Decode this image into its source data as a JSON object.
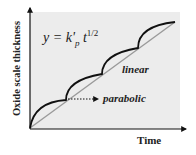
{
  "diagram": {
    "equation": {
      "lhs": "y = k'",
      "subscript": "p",
      "var": " t",
      "superscript": "1/2"
    },
    "curve_labels": {
      "linear": "linear",
      "parabolic": "parabolic"
    },
    "axes": {
      "xlabel": "Time",
      "ylabel": "Oxide scale thickness"
    },
    "colors": {
      "plot_background": "#ececec",
      "axis": "#111111",
      "linear_line": "#9a9a9a",
      "parabolic_curve": "#111111"
    },
    "segments": 4
  }
}
